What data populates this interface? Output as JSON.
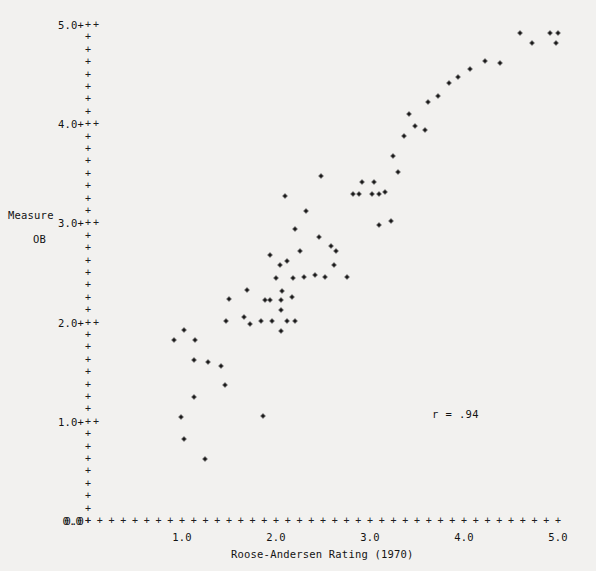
{
  "chart_data": {
    "type": "scatter",
    "title": "",
    "xlabel": "Roose-Andersen Rating (1970)",
    "ylabel_lines": [
      "Measure",
      "OB"
    ],
    "xlim": [
      0.0,
      5.0
    ],
    "ylim": [
      0.0,
      5.0
    ],
    "grid": false,
    "legend": null,
    "annotations": [
      {
        "text": "r = .94",
        "x": 4.0,
        "y": 1.08
      }
    ],
    "xticks": [
      {
        "value": 1.0,
        "label": "1.0"
      },
      {
        "value": 2.0,
        "label": "2.0"
      },
      {
        "value": 3.0,
        "label": "3.0"
      },
      {
        "value": 4.0,
        "label": "4.0"
      },
      {
        "value": 5.0,
        "label": "5.0"
      }
    ],
    "xtick_origin_label": "0.0",
    "yticks": [
      {
        "value": 1.0,
        "label": "1.0+"
      },
      {
        "value": 2.0,
        "label": "2.0+"
      },
      {
        "value": 3.0,
        "label": "3.0+"
      },
      {
        "value": 4.0,
        "label": "4.0+"
      },
      {
        "value": 5.0,
        "label": "5.0+"
      }
    ],
    "ytick_origin_label": "0.0",
    "axis_tick_glyph": "+",
    "axis_tick_color": "#1d1d1d",
    "point_color": "#1a1a1a",
    "background_color": "#f2f1ef",
    "points": [
      [
        0.99,
        1.05
      ],
      [
        1.02,
        0.83
      ],
      [
        1.13,
        1.25
      ],
      [
        1.24,
        0.62
      ],
      [
        0.92,
        1.82
      ],
      [
        1.02,
        1.93
      ],
      [
        1.14,
        1.82
      ],
      [
        1.13,
        1.62
      ],
      [
        1.28,
        1.6
      ],
      [
        1.42,
        1.56
      ],
      [
        1.47,
        2.02
      ],
      [
        1.46,
        1.37
      ],
      [
        1.66,
        2.06
      ],
      [
        1.5,
        2.24
      ],
      [
        1.69,
        2.33
      ],
      [
        1.72,
        1.99
      ],
      [
        1.84,
        2.02
      ],
      [
        1.96,
        2.02
      ],
      [
        1.86,
        1.06
      ],
      [
        2.05,
        1.92
      ],
      [
        2.12,
        2.02
      ],
      [
        2.2,
        2.02
      ],
      [
        2.05,
        2.13
      ],
      [
        2.05,
        2.23
      ],
      [
        2.17,
        2.26
      ],
      [
        1.94,
        2.23
      ],
      [
        1.88,
        2.23
      ],
      [
        2.0,
        2.45
      ],
      [
        2.04,
        2.58
      ],
      [
        2.12,
        2.62
      ],
      [
        1.94,
        2.68
      ],
      [
        2.18,
        2.45
      ],
      [
        2.3,
        2.46
      ],
      [
        2.06,
        2.32
      ],
      [
        2.26,
        2.72
      ],
      [
        2.2,
        2.94
      ],
      [
        2.32,
        3.12
      ],
      [
        2.1,
        3.28
      ],
      [
        2.42,
        2.48
      ],
      [
        2.52,
        2.46
      ],
      [
        2.62,
        2.58
      ],
      [
        2.58,
        2.77
      ],
      [
        2.46,
        2.86
      ],
      [
        2.64,
        2.72
      ],
      [
        2.76,
        2.46
      ],
      [
        2.48,
        3.48
      ],
      [
        2.82,
        3.3
      ],
      [
        2.88,
        3.3
      ],
      [
        3.02,
        3.3
      ],
      [
        3.1,
        3.3
      ],
      [
        2.92,
        3.42
      ],
      [
        3.04,
        3.42
      ],
      [
        3.16,
        3.32
      ],
      [
        3.1,
        2.98
      ],
      [
        3.22,
        3.02
      ],
      [
        3.3,
        3.52
      ],
      [
        3.24,
        3.68
      ],
      [
        3.36,
        3.88
      ],
      [
        3.48,
        3.98
      ],
      [
        3.58,
        3.94
      ],
      [
        3.42,
        4.1
      ],
      [
        3.62,
        4.22
      ],
      [
        3.72,
        4.28
      ],
      [
        3.84,
        4.42
      ],
      [
        3.94,
        4.48
      ],
      [
        4.06,
        4.56
      ],
      [
        4.22,
        4.64
      ],
      [
        4.38,
        4.62
      ],
      [
        4.6,
        4.92
      ],
      [
        4.72,
        4.82
      ],
      [
        4.92,
        4.92
      ],
      [
        5.0,
        4.92
      ],
      [
        4.98,
        4.82
      ]
    ]
  },
  "layout": {
    "plot_left_px": 88,
    "plot_bottom_px": 521,
    "px_per_x_unit": 94.0,
    "px_per_y_unit": 99.2
  }
}
